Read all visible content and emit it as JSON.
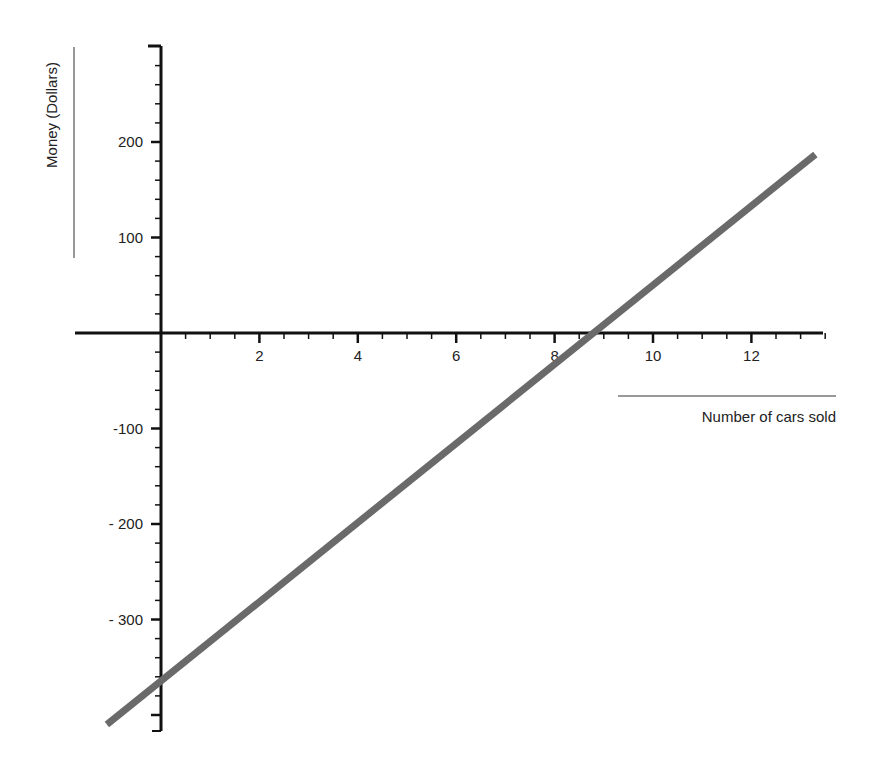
{
  "chart_data": {
    "type": "line",
    "title": "",
    "xlabel": "Number of cars sold",
    "ylabel": "Money (Dollars)",
    "xlim": [
      -1.7,
      13.5
    ],
    "ylim": [
      -415,
      300
    ],
    "x_ticks": [
      2,
      4,
      6,
      8,
      10,
      12
    ],
    "y_ticks": [
      200,
      100,
      -100,
      -200,
      -300
    ],
    "y_tick_labels": [
      "200",
      "100",
      "-100",
      "- 200",
      "- 300"
    ],
    "series": [
      {
        "name": "profit",
        "x": [
          -1.1,
          13.3
        ],
        "values": [
          -410,
          187
        ],
        "slope": 41.5,
        "intercept": -365
      }
    ],
    "x_intercept": 8.8,
    "grid": false,
    "legend": "none"
  }
}
